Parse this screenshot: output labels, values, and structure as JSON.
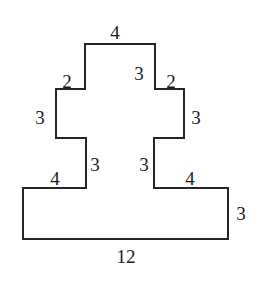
{
  "figure": {
    "stroke_color": "#262626",
    "fill_color": "#ffffff",
    "background_color": "#ffffff",
    "stroke_width": 2,
    "outline_points": "85,44 155,44 155,89 184,89 184,138 154,138 154,188 228,188 228,239 23,239 23,188 86,188 86,138 56,138 56,89 85,89",
    "labels": [
      {
        "id": "top-4",
        "text": "4",
        "x": 115,
        "y": 32
      },
      {
        "id": "inner-top-3",
        "text": "3",
        "x": 139,
        "y": 73
      },
      {
        "id": "left-2",
        "text": "2",
        "x": 67,
        "y": 81
      },
      {
        "id": "right-2",
        "text": "2",
        "x": 171,
        "y": 81
      },
      {
        "id": "left-3",
        "text": "3",
        "x": 40,
        "y": 117
      },
      {
        "id": "right-3",
        "text": "3",
        "x": 196,
        "y": 117
      },
      {
        "id": "inner-left-3",
        "text": "3",
        "x": 95,
        "y": 164
      },
      {
        "id": "inner-right-3",
        "text": "3",
        "x": 144,
        "y": 164
      },
      {
        "id": "left-4",
        "text": "4",
        "x": 55,
        "y": 178
      },
      {
        "id": "right-4",
        "text": "4",
        "x": 190,
        "y": 178
      },
      {
        "id": "far-right-3",
        "text": "3",
        "x": 241,
        "y": 213
      },
      {
        "id": "bottom-12",
        "text": "12",
        "x": 126,
        "y": 256
      }
    ]
  }
}
